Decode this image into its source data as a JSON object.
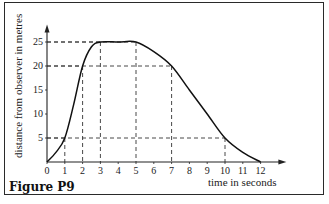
{
  "figure": {
    "caption": "Figure P9",
    "xlabel": "time in seconds",
    "ylabel": "distance from observer in metres"
  },
  "chart_data": {
    "type": "line",
    "title": "",
    "caption": "Figure P9",
    "xlabel": "time in seconds",
    "ylabel": "distance from observer in metres",
    "x_ticks": [
      0,
      1,
      2,
      3,
      4,
      5,
      6,
      7,
      8,
      9,
      10,
      11,
      12
    ],
    "y_ticks": [
      5,
      10,
      15,
      20,
      25
    ],
    "xlim": [
      0,
      13
    ],
    "ylim": [
      0,
      27
    ],
    "grid": false,
    "series": [
      {
        "name": "distance",
        "x": [
          0,
          0.5,
          1,
          1.5,
          2,
          2.5,
          3,
          4,
          5,
          6,
          7,
          8,
          9,
          10,
          11,
          12
        ],
        "values": [
          0,
          2,
          5,
          12,
          20,
          24,
          25,
          25,
          25,
          23,
          20,
          15,
          10,
          5,
          2,
          0
        ]
      }
    ],
    "reference_lines": [
      {
        "x": 1,
        "y": 5
      },
      {
        "x": 2,
        "y": 20
      },
      {
        "x": 3,
        "y": 25
      },
      {
        "x": 5,
        "y": 25
      },
      {
        "x": 7,
        "y": 20
      },
      {
        "x": 10,
        "y": 5
      }
    ]
  }
}
